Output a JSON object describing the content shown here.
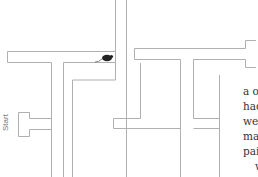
{
  "maze": {
    "start_label": "Start",
    "wall_color": "#aaaaaa",
    "mouse_color": "#222222"
  },
  "article": {
    "lines": [
      "a one",
      "had t",
      "went",
      "maps",
      "pair c",
      "wi"
    ]
  }
}
